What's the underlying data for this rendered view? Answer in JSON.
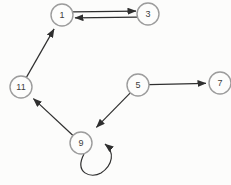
{
  "diagram": {
    "type": "directed-graph",
    "background_color": "#fcfcfb",
    "node_style": {
      "radius": 11,
      "fill": "#fdfdfc",
      "stroke": "#9c9c9c",
      "stroke_width": 1.4,
      "label_color": "#3d3d3d",
      "label_size": 9
    },
    "edge_style": {
      "color": "#2f2f2f",
      "stroke_width": 1.2,
      "parallel_offset": 3,
      "default_end_gap": 3
    },
    "nodes": [
      {
        "id": "1",
        "label": "1",
        "x": 62,
        "y": 15
      },
      {
        "id": "3",
        "label": "3",
        "x": 148,
        "y": 14
      },
      {
        "id": "11",
        "label": "11",
        "x": 21,
        "y": 87
      },
      {
        "id": "5",
        "label": "5",
        "x": 138,
        "y": 85
      },
      {
        "id": "7",
        "label": "7",
        "x": 220,
        "y": 83
      },
      {
        "id": "9",
        "label": "9",
        "x": 81,
        "y": 143
      }
    ],
    "edges": [
      {
        "from": "1",
        "to": "3",
        "gap": -2
      },
      {
        "from": "3",
        "to": "1",
        "gap": -1
      },
      {
        "from": "11",
        "to": "1",
        "gap": 2
      },
      {
        "from": "5",
        "to": "7",
        "gap": 0
      },
      {
        "from": "5",
        "to": "9",
        "gap": 8
      },
      {
        "from": "9",
        "to": "11",
        "gap": 3
      },
      {
        "from": "9",
        "to": "9",
        "self_loop": true
      }
    ]
  }
}
